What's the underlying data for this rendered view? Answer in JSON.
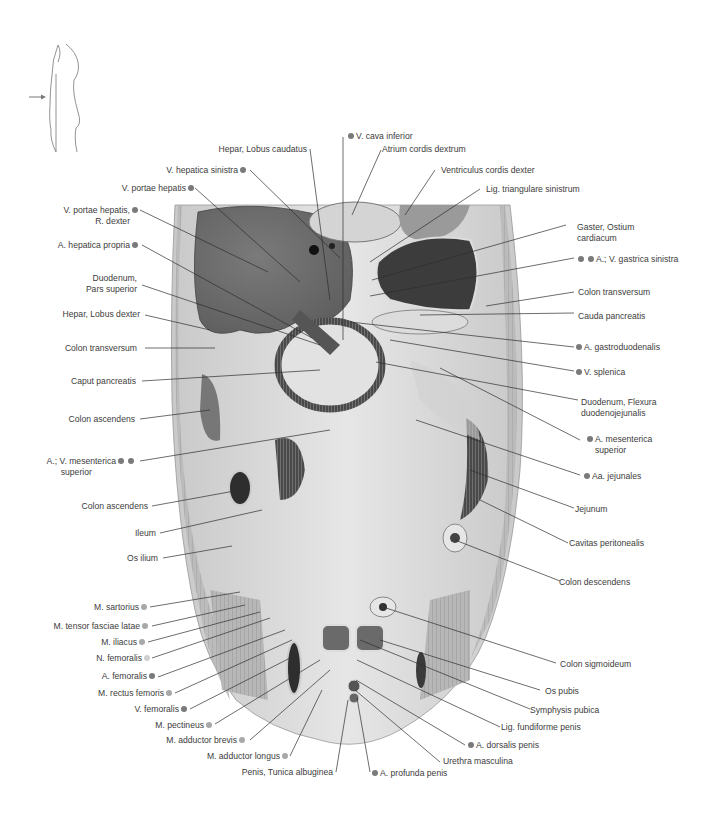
{
  "figure": {
    "orientation_icon": "body-profile-with-arrow-icon",
    "section_plane_arrow": "arrow-right-icon",
    "colors": {
      "background": "#ffffff",
      "tissue_light": "#d9d9d9",
      "tissue_mid": "#a9a9a9",
      "liver": "#6b6b6b",
      "mucosa_dark": "#3d3d3d",
      "label_text": "#3c3c3c",
      "dot_dark": "#7a7a7a",
      "dot_mid": "#a8a8a8",
      "dot_light": "#cfcfcf"
    }
  },
  "labels_left": [
    {
      "text": "V. portae hepatis",
      "dot": "dark"
    },
    {
      "text": "V. portae hepatis,",
      "text2": "R. dexter",
      "dot": "dark"
    },
    {
      "text": "A. hepatica propria",
      "dot": "dark"
    },
    {
      "text": "Duodenum,",
      "text2": "Pars superior"
    },
    {
      "text": "Hepar, Lobus dexter"
    },
    {
      "text": "Colon transversum"
    },
    {
      "text": "Caput pancreatis"
    },
    {
      "text": "Colon ascendens"
    },
    {
      "text": "A.; V. mesenterica",
      "text2": "superior",
      "dot": "dark",
      "dot2": "dark"
    },
    {
      "text": "Colon ascendens"
    },
    {
      "text": "Ileum"
    },
    {
      "text": "Os ilium"
    },
    {
      "text": "M. sartorius",
      "dot": "mid"
    },
    {
      "text": "M. tensor fasciae latae",
      "dot": "mid"
    },
    {
      "text": "M. iliacus",
      "dot": "mid"
    },
    {
      "text": "N. femoralis",
      "dot": "light"
    },
    {
      "text": "A. femoralis",
      "dot": "dark"
    },
    {
      "text": "M. rectus femoris",
      "dot": "mid"
    },
    {
      "text": "V. femoralis",
      "dot": "dark"
    },
    {
      "text": "M. pectineus",
      "dot": "mid"
    },
    {
      "text": "M. adductor brevis",
      "dot": "mid"
    },
    {
      "text": "M. adductor longus",
      "dot": "mid"
    },
    {
      "text": "Penis, Tunica albuginea"
    }
  ],
  "labels_top": [
    {
      "text": "V. cava inferior",
      "dot": "dark"
    },
    {
      "text": "Hepar, Lobus caudatus"
    },
    {
      "text": "Atrium cordis dextrum"
    },
    {
      "text": "V. hepatica sinistra",
      "dot": "dark"
    },
    {
      "text": "Ventriculus cordis dexter"
    }
  ],
  "labels_right": [
    {
      "text": "Lig. triangulare sinistrum"
    },
    {
      "text": "Gaster, Ostium",
      "text2": "cardiacum"
    },
    {
      "text": "A.; V. gastrica sinistra",
      "dot": "dark",
      "dot2": "dark"
    },
    {
      "text": "Colon transversum"
    },
    {
      "text": "Cauda pancreatis"
    },
    {
      "text": "A. gastroduodenalis",
      "dot": "dark"
    },
    {
      "text": "V. splenica",
      "dot": "dark"
    },
    {
      "text": "Duodenum, Flexura",
      "text2": "duodenojejunalis"
    },
    {
      "text": "A. mesenterica",
      "text2": "superior",
      "dot": "dark"
    },
    {
      "text": "Aa. jejunales",
      "dot": "dark"
    },
    {
      "text": "Jejunum"
    },
    {
      "text": "Cavitas peritonealis"
    },
    {
      "text": "Colon descendens"
    },
    {
      "text": "Colon sigmoideum"
    },
    {
      "text": "Os pubis"
    },
    {
      "text": "Symphysis pubica"
    },
    {
      "text": "Lig. fundiforme penis"
    },
    {
      "text": "A. dorsalis penis",
      "dot": "dark"
    },
    {
      "text": "Urethra masculina"
    },
    {
      "text": "A. profunda penis",
      "dot": "dark"
    }
  ]
}
